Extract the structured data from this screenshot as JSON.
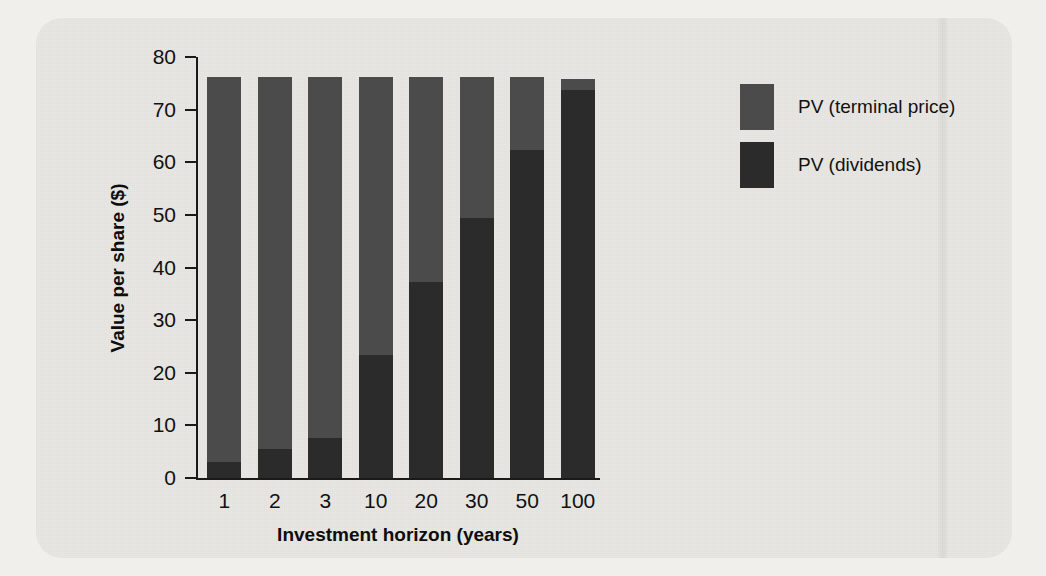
{
  "figure": {
    "background_color": "#e9e7e3",
    "page_color": "#f1efec"
  },
  "chart_data": {
    "type": "bar",
    "subtype": "stacked-vertical",
    "title": "",
    "xlabel": "Investment horizon (years)",
    "ylabel": "Value per share ($)",
    "categories": [
      "1",
      "2",
      "3",
      "10",
      "20",
      "30",
      "50",
      "100"
    ],
    "ylim": [
      0,
      80
    ],
    "yticks": [
      0,
      10,
      20,
      30,
      40,
      50,
      60,
      70,
      80
    ],
    "ytick_labels": [
      "0",
      "10",
      "20",
      "30",
      "40",
      "50",
      "60",
      "70",
      "80"
    ],
    "grid": false,
    "legend_position": "right",
    "series": [
      {
        "name": "PV (dividends)",
        "color": "#2b2b2b",
        "values": [
          3.0,
          5.5,
          7.6,
          23.4,
          37.3,
          49.4,
          62.4,
          73.8
        ]
      },
      {
        "name": "PV (terminal price)",
        "color": "#4b4b4b",
        "values": [
          73.2,
          70.7,
          68.6,
          52.8,
          38.9,
          26.8,
          13.8,
          2.0
        ]
      }
    ],
    "totals": [
      76.2,
      76.2,
      76.2,
      76.2,
      76.2,
      76.2,
      76.2,
      75.8
    ],
    "stack_order_bottom_to_top": [
      "PV (dividends)",
      "PV (terminal price)"
    ]
  },
  "legend": {
    "entries": [
      {
        "label": "PV (terminal price)",
        "color": "#4b4b4b"
      },
      {
        "label": "PV (dividends)",
        "color": "#2b2b2b"
      }
    ]
  }
}
